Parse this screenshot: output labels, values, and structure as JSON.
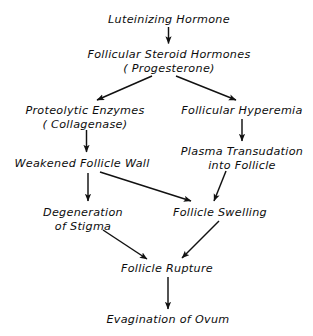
{
  "diagram": {
    "type": "flowchart",
    "background_color": "#ffffff",
    "text_color": "#0d0d0d",
    "arrow_color": "#111111",
    "nodes": [
      {
        "id": "luteinizing-hormone",
        "line1": "Luteinizing Hormone",
        "line2": ""
      },
      {
        "id": "follicular-steroid-hormones",
        "line1": "Follicular Steroid Hormones",
        "line2": "( Progesterone)"
      },
      {
        "id": "proteolytic-enzymes",
        "line1": "Proteolytic Enzymes",
        "line2": "( Collagenase)"
      },
      {
        "id": "follicular-hyperemia",
        "line1": "Follicular Hyperemia",
        "line2": ""
      },
      {
        "id": "weakened-follicle-wall",
        "line1": "Weakened Follicle Wall",
        "line2": ""
      },
      {
        "id": "plasma-transudation",
        "line1": "Plasma Transudation",
        "line2": "into Follicle"
      },
      {
        "id": "degeneration-of-stigma",
        "line1": "Degeneration",
        "line2": "of Stigma"
      },
      {
        "id": "follicle-swelling",
        "line1": "Follicle Swelling",
        "line2": ""
      },
      {
        "id": "follicle-rupture",
        "line1": "Follicle Rupture",
        "line2": ""
      },
      {
        "id": "evagination-of-ovum",
        "line1": "Evagination of Ovum",
        "line2": ""
      }
    ],
    "edges": [
      {
        "from": "luteinizing-hormone",
        "to": "follicular-steroid-hormones",
        "shape": "vertical"
      },
      {
        "from": "follicular-steroid-hormones",
        "to": "proteolytic-enzymes",
        "shape": "diagonal-left"
      },
      {
        "from": "follicular-steroid-hormones",
        "to": "follicular-hyperemia",
        "shape": "diagonal-right"
      },
      {
        "from": "proteolytic-enzymes",
        "to": "weakened-follicle-wall",
        "shape": "vertical"
      },
      {
        "from": "follicular-hyperemia",
        "to": "plasma-transudation",
        "shape": "vertical"
      },
      {
        "from": "weakened-follicle-wall",
        "to": "degeneration-of-stigma",
        "shape": "vertical"
      },
      {
        "from": "weakened-follicle-wall",
        "to": "follicle-swelling",
        "shape": "diagonal-right"
      },
      {
        "from": "plasma-transudation",
        "to": "follicle-swelling",
        "shape": "diagonal-left"
      },
      {
        "from": "degeneration-of-stigma",
        "to": "follicle-rupture",
        "shape": "diagonal-right"
      },
      {
        "from": "follicle-swelling",
        "to": "follicle-rupture",
        "shape": "diagonal-left"
      },
      {
        "from": "follicle-rupture",
        "to": "evagination-of-ovum",
        "shape": "vertical"
      }
    ]
  }
}
